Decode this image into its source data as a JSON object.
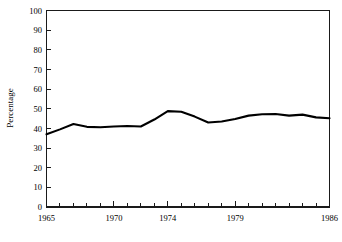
{
  "chart_data": {
    "type": "line",
    "title": "",
    "xlabel": "",
    "ylabel": "Percentage",
    "xlim": [
      1965,
      1986
    ],
    "ylim": [
      0,
      100
    ],
    "grid": false,
    "legend": "none",
    "y_ticks": [
      0,
      10,
      20,
      30,
      40,
      50,
      60,
      70,
      80,
      90,
      100
    ],
    "y_tick_labels": [
      "0",
      "10",
      "20",
      "30",
      "40",
      "50",
      "60",
      "70",
      "80",
      "90",
      "100"
    ],
    "x_ticks": [
      1965,
      1966,
      1967,
      1968,
      1969,
      1970,
      1971,
      1972,
      1973,
      1974,
      1975,
      1976,
      1977,
      1978,
      1979,
      1980,
      1981,
      1982,
      1983,
      1984,
      1985,
      1986
    ],
    "x_tick_labels": [
      "1965",
      "1970",
      "1974",
      "1979",
      "1986"
    ],
    "x_labeled_ticks": [
      1965,
      1970,
      1974,
      1979,
      1986
    ],
    "x": [
      1965,
      1966,
      1967,
      1968,
      1969,
      1970,
      1971,
      1972,
      1973,
      1974,
      1975,
      1976,
      1977,
      1978,
      1979,
      1980,
      1981,
      1982,
      1983,
      1984,
      1985,
      1986
    ],
    "values": [
      37.0,
      39.5,
      42.2,
      40.8,
      40.6,
      41.0,
      41.2,
      41.0,
      44.5,
      48.8,
      48.5,
      46.0,
      43.0,
      43.5,
      44.8,
      46.5,
      47.2,
      47.3,
      46.5,
      47.0,
      45.6,
      45.2
    ],
    "series": [
      {
        "name": "Percentage",
        "color": "#000000",
        "values": [
          37.0,
          39.5,
          42.2,
          40.8,
          40.6,
          41.0,
          41.2,
          41.0,
          44.5,
          48.8,
          48.5,
          46.0,
          43.0,
          43.5,
          44.8,
          46.5,
          47.2,
          47.3,
          46.5,
          47.0,
          45.6,
          45.2
        ]
      }
    ]
  },
  "axes": {
    "y_title": "Percentage"
  },
  "colors": {
    "line": "#000000",
    "frame": "#1a1a1a",
    "background": "#ffffff"
  },
  "caption": {
    "text": ""
  }
}
